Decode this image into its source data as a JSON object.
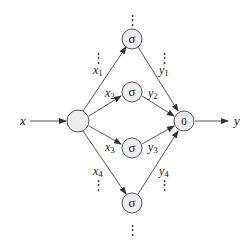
{
  "diagram": {
    "colors": {
      "node_fill": "#ececec",
      "stroke": "#444444",
      "text": "#222222"
    },
    "input": {
      "label": "x",
      "node_label": ""
    },
    "output": {
      "label": "y",
      "node_label": "0"
    },
    "hidden_units": [
      {
        "activation": "σ",
        "in_label": "x",
        "in_sub": "1",
        "out_label": "y",
        "out_sub": "1"
      },
      {
        "activation": "σ",
        "in_label": "x",
        "in_sub": "2",
        "out_label": "y",
        "out_sub": "2"
      },
      {
        "activation": "σ",
        "in_label": "x",
        "in_sub": "3",
        "out_label": "y",
        "out_sub": "3"
      },
      {
        "activation": "σ",
        "in_label": "x",
        "in_sub": "4",
        "out_label": "y",
        "out_sub": "4"
      }
    ],
    "ellipsis": "⋮"
  }
}
